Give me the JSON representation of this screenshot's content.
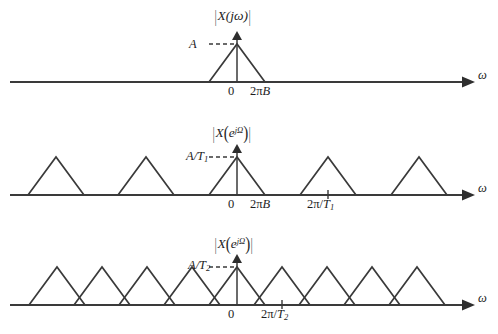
{
  "figure": {
    "title_visible": false,
    "background_color": "#ffffff",
    "ink_color": "#3a3a3a",
    "width": 498,
    "height": 334
  },
  "chart_data": {
    "type": "line",
    "title": "",
    "xlabel": "ω",
    "ylabel": "",
    "grid": false,
    "legend": null,
    "panels": [
      {
        "id": "panel-1",
        "ylabel": "|X(jω)|",
        "ylabel_parts": {
          "x": "X",
          "arg": "jω",
          "kind": "continuous"
        },
        "amplitude_label": "A",
        "amplitude_value": 1,
        "xlabel": "ω",
        "axis_baseline_y": 82,
        "origin_x": 237,
        "tick_labels": [
          {
            "text": "0",
            "x": 237,
            "kind": "origin"
          },
          {
            "text": "2πB",
            "x": 265,
            "kind": "bandedge"
          }
        ],
        "triangle_half_width": 28,
        "triangle_height": 38,
        "triangle_centers": [
          237
        ],
        "replication_period": null,
        "axis_x_start": 10,
        "axis_x_end": 462
      },
      {
        "id": "panel-2",
        "ylabel": "|X(e^{jΩ})|",
        "ylabel_parts": {
          "x": "X",
          "arg": "e",
          "exp": "jΩ",
          "kind": "discrete"
        },
        "amplitude_label": "A/T₁",
        "amplitude_value": 1,
        "xlabel": "ω",
        "axis_baseline_y": 195,
        "origin_x": 237,
        "tick_labels": [
          {
            "text": "0",
            "x": 237,
            "kind": "origin"
          },
          {
            "text": "2πB",
            "x": 265,
            "kind": "bandedge"
          },
          {
            "text": "2π/T₁",
            "x": 328,
            "kind": "sampling-rate"
          }
        ],
        "triangle_half_width": 28,
        "triangle_height": 38,
        "triangle_centers": [
          56,
          146,
          237,
          328,
          419
        ],
        "replication_period": 91,
        "axis_x_start": 10,
        "axis_x_end": 462
      },
      {
        "id": "panel-3",
        "ylabel": "|X(e^{jΩ})|",
        "ylabel_parts": {
          "x": "X",
          "arg": "e",
          "exp": "jΩ",
          "kind": "discrete"
        },
        "amplitude_label": "A/T₂",
        "amplitude_value": 1,
        "xlabel": "ω",
        "axis_baseline_y": 305,
        "origin_x": 237,
        "tick_labels": [
          {
            "text": "0",
            "x": 237,
            "kind": "origin"
          },
          {
            "text": "2π/T₂",
            "x": 282,
            "kind": "sampling-rate"
          }
        ],
        "triangle_half_width": 28,
        "triangle_height": 38,
        "triangle_centers": [
          57,
          102,
          147,
          192,
          237,
          282,
          327,
          372,
          417
        ],
        "replication_period": 45,
        "axis_x_start": 10,
        "axis_x_end": 462
      }
    ]
  },
  "labels": {
    "panel1": {
      "magnitude_prefix": "",
      "mag_x": "X",
      "mag_open": "(",
      "mag_arg": "jω",
      "mag_close": ")",
      "amplitude": "A",
      "origin": "0",
      "bandedge_pi": "2π",
      "bandedge_b": "B",
      "omega": "ω"
    },
    "panel2": {
      "mag_x": "X",
      "mag_open": "(",
      "mag_base": "e",
      "mag_exp": "jΩ",
      "mag_close": ")",
      "amplitude_num": "A/T",
      "amplitude_sub": "1",
      "origin": "0",
      "bandedge_pi": "2π",
      "bandedge_b": "B",
      "rate_pi": "2π/",
      "rate_t": "T",
      "rate_sub": "1",
      "omega": "ω"
    },
    "panel3": {
      "mag_x": "X",
      "mag_open": "(",
      "mag_base": "e",
      "mag_exp": "jΩ",
      "mag_close": ")",
      "amplitude_num": "A/T",
      "amplitude_sub": "2",
      "origin": "0",
      "rate_pi": "2π/",
      "rate_t": "T",
      "rate_sub": "2",
      "omega": "ω"
    }
  }
}
